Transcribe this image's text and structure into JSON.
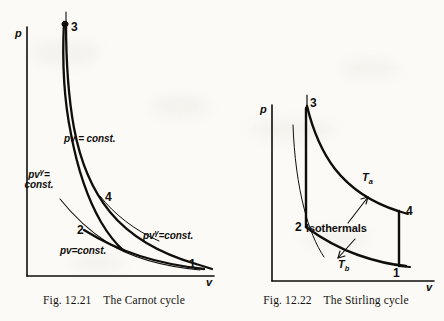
{
  "page": {
    "background_color": "#fbfaf7",
    "ink_color": "#100e0c"
  },
  "figures": [
    {
      "id": "carnot",
      "caption": "Fig. 12.21    The Carnot cycle",
      "caption_number": "Fig. 12.21",
      "caption_title": "The Carnot cycle",
      "axes": {
        "y_label": "p",
        "x_label": "v"
      },
      "state_points": [
        {
          "id": "1",
          "label": "1"
        },
        {
          "id": "2",
          "label": "2"
        },
        {
          "id": "3",
          "label": "3"
        },
        {
          "id": "4",
          "label": "4"
        }
      ],
      "curve_labels": [
        {
          "id": "isotherm-upper",
          "text_html": "pv = const.",
          "text": "pv = const."
        },
        {
          "id": "adiabat-left",
          "line1_html": "pv<sup>&#947;</sup>=",
          "line2": "const.",
          "text": "pvγ= const."
        },
        {
          "id": "adiabat-right",
          "text_html": "pv<sup>&#947;</sup>=const.",
          "text": "pvγ=const."
        },
        {
          "id": "isotherm-lower",
          "text_html": "pv=const.",
          "text": "pv=const."
        }
      ]
    },
    {
      "id": "stirling",
      "caption": "Fig. 12.22    The Stirling cycle",
      "caption_number": "Fig. 12.22",
      "caption_title": "The Stirling cycle",
      "axes": {
        "y_label": "p",
        "x_label": "v"
      },
      "state_points": [
        {
          "id": "1",
          "label": "1"
        },
        {
          "id": "2",
          "label": "2"
        },
        {
          "id": "3",
          "label": "3"
        },
        {
          "id": "4",
          "label": "4"
        }
      ],
      "curve_labels": [
        {
          "id": "temp-hot",
          "text_html": "T<sub>a</sub>",
          "text": "Ta"
        },
        {
          "id": "temp-cold",
          "text_html": "T<sub>b</sub>",
          "text": "Tb"
        },
        {
          "id": "isothermals",
          "text": "Isothermals"
        }
      ]
    }
  ],
  "chart_data": [
    {
      "type": "line",
      "title": "The Carnot cycle",
      "xlabel": "v",
      "ylabel": "p",
      "grid": false,
      "legend": "none",
      "annotations": [
        "pv = const.",
        "pvγ = const.",
        "pvγ = const.",
        "pv = const."
      ],
      "point_labels": [
        "1",
        "2",
        "3",
        "4"
      ],
      "series": [
        {
          "name": "isothermal 3-4 (pv = const., high T)",
          "x": [
            0.215,
            0.24,
            0.28,
            0.34,
            0.42,
            0.53,
            0.66,
            0.8,
            0.92,
            1.0
          ],
          "y": [
            1.0,
            0.9,
            0.77,
            0.62,
            0.48,
            0.36,
            0.27,
            0.21,
            0.17,
            0.15
          ]
        },
        {
          "name": "adiabatic 3-2 (pv^gamma = const.)",
          "x": [
            0.215,
            0.23,
            0.26,
            0.3,
            0.35,
            0.41,
            0.47,
            0.52
          ],
          "y": [
            1.0,
            0.88,
            0.71,
            0.54,
            0.39,
            0.28,
            0.21,
            0.18
          ]
        },
        {
          "name": "isothermal 2-1 (pv = const., low T)",
          "x": [
            0.52,
            0.62,
            0.74,
            0.86,
            0.98,
            1.1,
            1.22
          ],
          "y": [
            0.18,
            0.145,
            0.115,
            0.092,
            0.075,
            0.062,
            0.055
          ]
        },
        {
          "name": "adiabatic 4-1 (pv^gamma = const.)",
          "x": [
            0.66,
            0.78,
            0.9,
            1.02,
            1.14,
            1.22
          ],
          "y": [
            0.27,
            0.2,
            0.145,
            0.105,
            0.075,
            0.055
          ]
        }
      ]
    },
    {
      "type": "line",
      "title": "The Stirling cycle",
      "xlabel": "v",
      "ylabel": "p",
      "grid": false,
      "legend": "none",
      "annotations": [
        "Ta",
        "Tb",
        "Isothermals"
      ],
      "point_labels": [
        "1",
        "2",
        "3",
        "4"
      ],
      "series": [
        {
          "name": "isothermal Ta (3-4)",
          "x": [
            0.3,
            0.38,
            0.48,
            0.6,
            0.74,
            0.88,
            1.0
          ],
          "y": [
            1.0,
            0.8,
            0.63,
            0.5,
            0.41,
            0.35,
            0.31
          ]
        },
        {
          "name": "isothermal Tb (2-1)",
          "x": [
            0.3,
            0.4,
            0.52,
            0.66,
            0.82,
            1.0
          ],
          "y": [
            0.26,
            0.2,
            0.155,
            0.125,
            0.105,
            0.095
          ]
        },
        {
          "name": "isochoric 2-3 (constant volume)",
          "x": [
            0.3,
            0.3
          ],
          "y": [
            0.26,
            1.0
          ]
        },
        {
          "name": "isochoric 4-1 (constant volume)",
          "x": [
            1.0,
            1.0
          ],
          "y": [
            0.31,
            0.095
          ]
        },
        {
          "name": "reference isothermal (unlabelled)",
          "x": [
            0.12,
            0.15,
            0.19,
            0.24,
            0.29
          ],
          "y": [
            0.86,
            0.6,
            0.4,
            0.27,
            0.2
          ]
        }
      ]
    }
  ]
}
